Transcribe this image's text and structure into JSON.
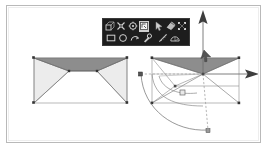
{
  "app": {
    "title": "3D modeling viewport",
    "background_color": "#ffffff",
    "frame_border_color": "#b9b9b9"
  },
  "toolbar": {
    "name": "floating-modeling-toolbar",
    "background_color": "#1d1d1d",
    "active_button_color": "#cfcfcf",
    "rows": [
      {
        "buttons": [
          {
            "icon": "extrude-face-icon",
            "label": "Extrude",
            "active": false
          },
          {
            "icon": "snap-vertex-icon",
            "label": "Snap to vertex",
            "active": false
          },
          {
            "icon": "rotate-gizmo-icon",
            "label": "Rotate",
            "active": false
          },
          {
            "icon": "move-gizmo-icon",
            "label": "Move",
            "active": true
          },
          {
            "icon": "cursor-arrow-icon",
            "label": "Select",
            "active": false
          },
          {
            "icon": "paint-material-icon",
            "label": "Material",
            "active": false
          },
          {
            "icon": "scale-gizmo-icon",
            "label": "Scale",
            "active": false
          }
        ]
      },
      {
        "buttons": [
          {
            "icon": "rectangle-tool-icon",
            "label": "Rectangle",
            "active": false
          },
          {
            "icon": "circle-tool-icon",
            "label": "Circle",
            "active": false
          },
          {
            "icon": "arc-tool-icon",
            "label": "Arc",
            "active": false
          },
          {
            "icon": "eyedropper-icon",
            "label": "Eyedropper",
            "active": false
          },
          {
            "icon": "measure-tool-icon",
            "label": "Measure",
            "active": false
          },
          {
            "icon": "protractor-icon",
            "label": "Protractor",
            "active": false
          }
        ]
      }
    ]
  },
  "viewport": {
    "objects": [
      {
        "name": "left-solid",
        "type": "hip-roof-polyhedron-wireframe",
        "edge_color": "#6e6e6e",
        "top_face_color": "#8f8f8f",
        "side_face_color": "#e8e8e8",
        "vertex_marker_color": "#3a3a3a"
      },
      {
        "name": "right-solid",
        "type": "hip-roof-polyhedron-wireframe",
        "edge_color": "#6e6e6e",
        "top_face_color": "#8f8f8f",
        "side_face_color": "#f2f2f2",
        "vertex_marker_color": "#3a3a3a"
      }
    ],
    "gizmo": {
      "name": "transform-gizmo",
      "vertical_axis_color": "#6b6b6b",
      "vertical_arrowhead_color": "#3d3d3d",
      "horizontal_axis_color": "#6b6b6b",
      "horizontal_arrowhead_color": "#3d3d3d",
      "guide_line_color": "#9a9a9a",
      "guide_line_style": "dashed",
      "arc_color": "#7d7d7d",
      "handle_marker_color": "#5a5a5a"
    },
    "annotations": [
      {
        "name": "left-guide-endpoint-marker",
        "text": "",
        "x": 136,
        "y": 72
      },
      {
        "name": "bottom-guide-endpoint-marker",
        "text": "",
        "x": 206,
        "y": 130
      },
      {
        "name": "right-angle-marker",
        "text": "",
        "x": 176,
        "y": 90
      }
    ]
  }
}
